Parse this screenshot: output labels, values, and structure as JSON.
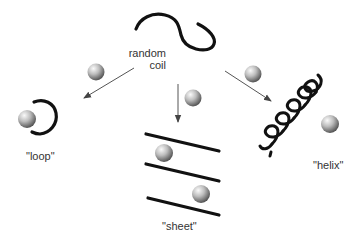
{
  "diagram": {
    "nodes": {
      "random_coil": {
        "line1": "random",
        "line2": "coil"
      },
      "loop": {
        "label": "\"loop\""
      },
      "sheet": {
        "label": "\"sheet\""
      },
      "helix": {
        "label": "\"helix\""
      }
    },
    "edges": [
      {
        "from": "random_coil",
        "to": "loop"
      },
      {
        "from": "random_coil",
        "to": "sheet"
      },
      {
        "from": "random_coil",
        "to": "helix"
      }
    ],
    "colors": {
      "strand": "#111111",
      "arrow": "#555555",
      "sphere_light": "#f4f4f4",
      "sphere_dark": "#5a5a5a",
      "text": "#333333"
    }
  }
}
